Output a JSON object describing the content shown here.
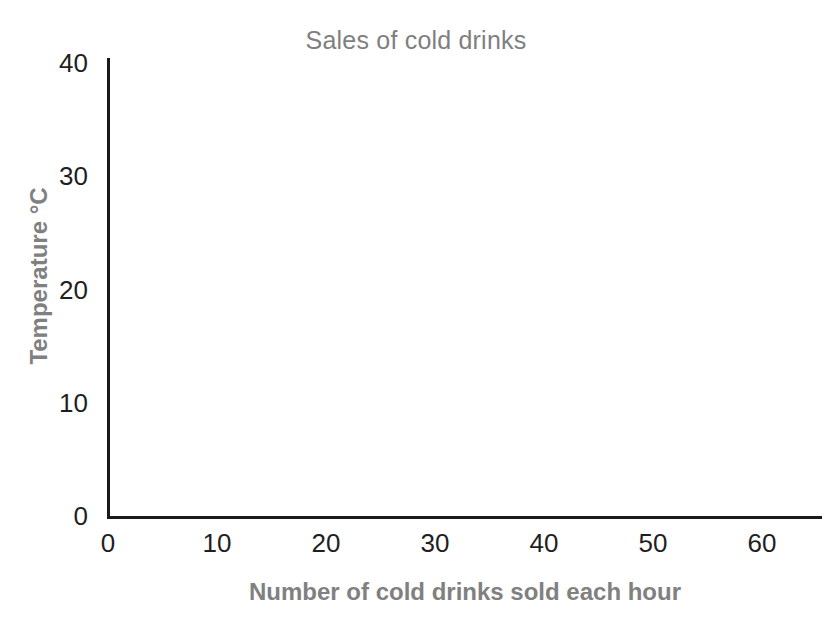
{
  "chart_data": {
    "type": "scatter",
    "title": "Sales of cold drinks",
    "subtitle": "",
    "xlabel": "Number of cold drinks sold each hour",
    "ylabel": "Temperature °C",
    "x": [],
    "values": [],
    "series": [],
    "xlim": [
      0,
      65
    ],
    "ylim": [
      0,
      40
    ],
    "xticks": [
      "0",
      "10",
      "20",
      "30",
      "40",
      "50",
      "60"
    ],
    "xtick_values": [
      0,
      10,
      20,
      30,
      40,
      50,
      60
    ],
    "yticks": [
      "0",
      "10",
      "20",
      "30",
      "40"
    ],
    "ytick_values": [
      0,
      10,
      20,
      30,
      40
    ],
    "grid": false,
    "legend": false,
    "legend_position": "none",
    "annotations": [],
    "note": "Empty axes template - no data plotted"
  },
  "style": {
    "title_color": "#7f7f7f",
    "axis_title_color": "#808080",
    "tick_color": "#1f1f1f",
    "axis_line_color": "#1a1a1a",
    "background": "#ffffff"
  }
}
